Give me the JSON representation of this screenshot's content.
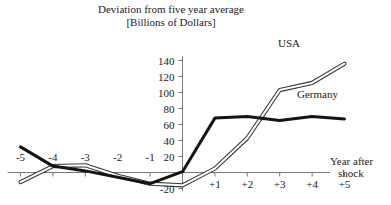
{
  "chart_data": {
    "type": "line",
    "title": "Deviation from five year average",
    "subtitle": "[Billions of Dollars]",
    "xlabel_line1": "Year after",
    "xlabel_line2": "shock",
    "ylabel": "",
    "grid": false,
    "legend_position": "inline-right",
    "xlim": [
      -5.4,
      5.4
    ],
    "ylim": [
      -24,
      145
    ],
    "x": [
      -5,
      -4,
      -3,
      -2,
      -1,
      0,
      1,
      2,
      3,
      4,
      5
    ],
    "categories": [
      "-5",
      "-4",
      "-3",
      "-2",
      "-1",
      "0",
      "+1",
      "+2",
      "+3",
      "+4",
      "+5"
    ],
    "xticks": [
      -5,
      -4,
      -3,
      -2,
      -1,
      1,
      2,
      3,
      4,
      5
    ],
    "xtick_labels": [
      "-5",
      "-4",
      "-3",
      "-2",
      "-1",
      "+1",
      "+2",
      "+3",
      "+4",
      "+5"
    ],
    "yticks": [
      -20,
      20,
      40,
      60,
      80,
      100,
      120,
      140
    ],
    "ytick_labels": [
      "-20",
      "20",
      "40",
      "60",
      "80",
      "100",
      "120",
      "140"
    ],
    "series": [
      {
        "name": "USA",
        "style": "double-line",
        "color": "#3a3a3a",
        "values": [
          -12,
          8,
          9,
          -4,
          -14,
          -16,
          5,
          43,
          103,
          112,
          136
        ]
      },
      {
        "name": "Germany",
        "style": "thick-line",
        "color": "#141414",
        "values": [
          32,
          8,
          2,
          -6,
          -14,
          1,
          68,
          70,
          65,
          70,
          67
        ]
      }
    ]
  }
}
